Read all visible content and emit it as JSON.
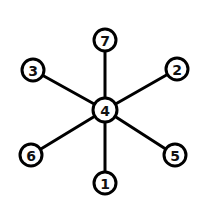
{
  "graph": {
    "type": "star",
    "center": "4",
    "colors": {
      "stroke": "#000000",
      "fill": "#ffffff",
      "label": "#111111"
    },
    "nodes": [
      {
        "id": "7",
        "label": "7",
        "x": 105,
        "y": 40,
        "r": 11
      },
      {
        "id": "3",
        "label": "3",
        "x": 33,
        "y": 70,
        "r": 11
      },
      {
        "id": "2",
        "label": "2",
        "x": 177,
        "y": 69,
        "r": 11
      },
      {
        "id": "4",
        "label": "4",
        "x": 105,
        "y": 110,
        "r": 12
      },
      {
        "id": "6",
        "label": "6",
        "x": 31,
        "y": 155,
        "r": 11
      },
      {
        "id": "5",
        "label": "5",
        "x": 175,
        "y": 155,
        "r": 11
      },
      {
        "id": "1",
        "label": "1",
        "x": 105,
        "y": 183,
        "r": 11
      }
    ],
    "edges": [
      {
        "from": "4",
        "to": "7"
      },
      {
        "from": "4",
        "to": "3"
      },
      {
        "from": "4",
        "to": "2"
      },
      {
        "from": "4",
        "to": "6"
      },
      {
        "from": "4",
        "to": "5"
      },
      {
        "from": "4",
        "to": "1"
      }
    ]
  }
}
